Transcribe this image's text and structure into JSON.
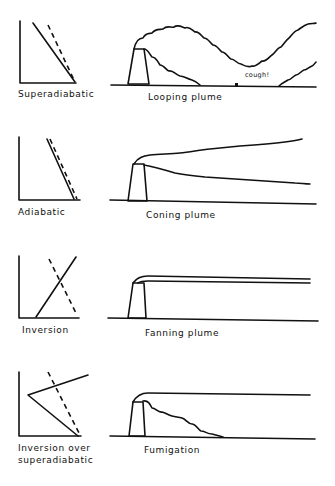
{
  "panels": [
    {
      "id": "looping",
      "lapse_label": "Superadiabatic",
      "plume_label": "Looping plume",
      "annotation": "cough!"
    },
    {
      "id": "coning",
      "lapse_label": "Adiabatic",
      "plume_label": "Coning plume"
    },
    {
      "id": "fanning",
      "lapse_label": "Inversion",
      "plume_label": "Fanning plume"
    },
    {
      "id": "fumigation",
      "lapse_label_line1": "Inversion over",
      "lapse_label_line2": "superadiabatic",
      "plume_label": "Fumigation"
    }
  ],
  "colors": {
    "ink": "#111111",
    "background": "#ffffff"
  }
}
